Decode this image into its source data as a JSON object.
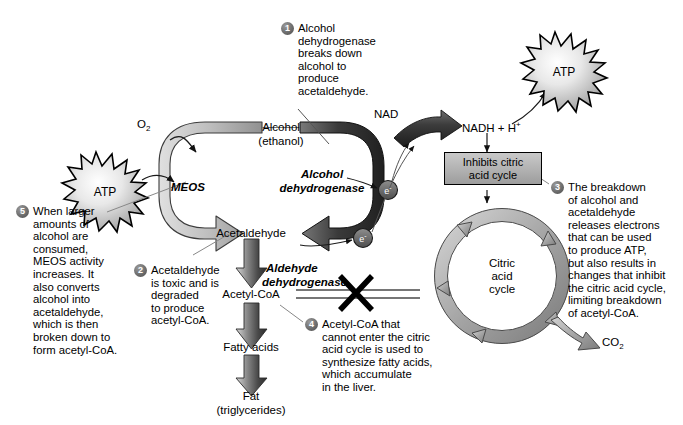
{
  "diagram": {
    "colors": {
      "badge": "#5d5d5d",
      "arrow_light": "#b5b5b5",
      "arrow_dark": "#3a3a3a",
      "box_fill": "#b3b3b3",
      "outline": "#000000",
      "background": "#ffffff"
    }
  },
  "labels": {
    "o2": "O2",
    "o2_main": "O",
    "o2_sub": "2",
    "atp_left": "ATP",
    "atp_right": "ATP",
    "meos": "MEOS",
    "alcohol_line1": "Alcohol",
    "alcohol_line2": "(ethanol)",
    "alcohol_dehydrogenase_line1": "Alcohol",
    "alcohol_dehydrogenase_line2": "dehydrogenase",
    "acetaldehyde": "Acetaldehyde",
    "aldehyde_dehydrogenase_line1": "Aldehyde",
    "aldehyde_dehydrogenase_line2": "dehydrogenase",
    "acetyl_coa": "Acetyl-CoA",
    "fatty_acids": "Fatty acids",
    "fat_line1": "Fat",
    "fat_line2": "(triglycerides)",
    "nad": "NAD",
    "nadh": "NADH + H",
    "nadh_sup": "+",
    "electron": "e",
    "electron_sup": "-",
    "inhibits_line1": "Inhibits citric",
    "inhibits_line2": "acid cycle",
    "citric_line1": "Citric",
    "citric_line2": "acid",
    "citric_line3": "cycle",
    "co2_main": "CO",
    "co2_sub": "2"
  },
  "callouts": [
    {
      "number": "1",
      "text": "Alcohol dehydrogenase breaks down alcohol to produce acetaldehyde.",
      "lines": [
        "Alcohol",
        "dehydrogenase",
        "breaks down",
        "alcohol to",
        "produce",
        "acetaldehyde."
      ]
    },
    {
      "number": "2",
      "text": "Acetaldehyde is toxic and is degraded to produce acetyl-CoA.",
      "lines": [
        "Acetaldehyde",
        "is toxic and is",
        "degraded",
        "to produce",
        "acetyl-CoA."
      ]
    },
    {
      "number": "3",
      "text": "The breakdown of alcohol and acetaldehyde releases electrons that can be used to produce ATP, but also results in changes that inhibit the citric acid cycle, limiting breakdown of acetyl-CoA.",
      "lines": [
        "The breakdown",
        "of alcohol and",
        "acetaldehyde",
        "releases electrons",
        "that can be used",
        "to produce ATP,",
        "but also results in",
        "changes that inhibit",
        "the citric acid cycle,",
        "limiting breakdown",
        "of acetyl-CoA."
      ]
    },
    {
      "number": "4",
      "text": "Acetyl-CoA that cannot enter the citric acid cycle is used to synthesize fatty acids, which accumulate in the liver.",
      "lines": [
        "Acetyl-CoA that",
        "cannot enter the citric",
        "acid cycle is used to",
        "synthesize fatty acids,",
        "which accumulate",
        "in the liver."
      ]
    },
    {
      "number": "5",
      "text": "When larger amounts of alcohol are consumed, MEOS activity increases. It also converts alcohol into acetaldehyde, which is then broken down to form acetyl-CoA.",
      "lines": [
        "When larger",
        "amounts of",
        "alcohol are",
        "consumed,",
        "MEOS activity",
        "increases. It",
        "also converts",
        "alcohol into",
        "acetaldehyde,",
        "which is then",
        "broken down to",
        "form acetyl-CoA."
      ]
    }
  ]
}
